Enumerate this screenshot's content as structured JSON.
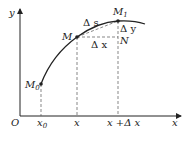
{
  "diagram": {
    "axes": {
      "origin_label": "O",
      "x_axis_label": "x",
      "y_axis_label": "y"
    },
    "points": {
      "M0": {
        "label": "M",
        "sub": "0"
      },
      "M": {
        "label": "M"
      },
      "M1": {
        "label": "M",
        "sub": "1"
      },
      "N": {
        "label": "N"
      }
    },
    "ticks": {
      "x0": {
        "label": "x",
        "sub": "0"
      },
      "x": {
        "label": "x"
      },
      "x_plus_dx": {
        "label": "x +Δ x"
      }
    },
    "annotations": {
      "delta_s": "Δ s",
      "delta_x": "Δ x",
      "delta_y": "Δ y"
    },
    "colors": {
      "stroke": "#222222",
      "dashed": "#555555"
    }
  }
}
